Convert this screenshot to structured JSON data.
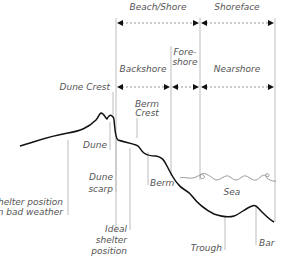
{
  "zones": {
    "top_row": [
      {
        "label": "Beach/Shore"
      },
      {
        "label": "Shoreface"
      }
    ],
    "second_row": [
      {
        "label": "Backshore"
      },
      {
        "label": "Fore-",
        "label2": "shore"
      },
      {
        "label": "Nearshore"
      }
    ]
  },
  "features": {
    "dune_crest": "Dune Crest",
    "dune": "Dune",
    "berm_crest_1": "Berm",
    "berm_crest_2": "Crest",
    "berm": "Berm",
    "sea": "Sea",
    "dune_scarp_1": "Dune",
    "dune_scarp_2": "scarp",
    "trough": "Trough",
    "bar": "Bar"
  },
  "shelter": {
    "bad_weather_1": "Shelter position",
    "bad_weather_2": "in bad weather",
    "ideal_1": "Ideal",
    "ideal_2": "shelter",
    "ideal_3": "position"
  },
  "colors": {
    "profile": "#111111",
    "guide": "#bdbdbd",
    "text": "#555555",
    "sea": "#999999"
  }
}
